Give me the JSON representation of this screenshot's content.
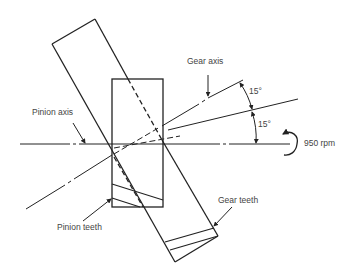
{
  "figure": {
    "labels": {
      "gear_axis": "Gear axis",
      "pinion_axis": "Pinion axis",
      "pinion_teeth": "Pinion teeth",
      "gear_teeth": "Gear teeth",
      "angle_upper": "15°",
      "angle_lower": "15°",
      "speed": "950 rpm"
    },
    "colors": {
      "line": "#222222",
      "text": "#444444",
      "background": "#ffffff"
    }
  }
}
